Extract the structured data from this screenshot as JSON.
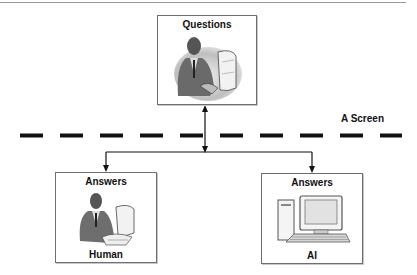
{
  "diagram": {
    "questions_box": {
      "title": "Questions",
      "icon": "person-at-computer-icon"
    },
    "screen_divider": {
      "label": "A Screen",
      "style": "dashed"
    },
    "answers_human_box": {
      "title": "Answers",
      "caption": "Human",
      "icon": "person-at-computer-icon"
    },
    "answers_ai_box": {
      "title": "Answers",
      "caption": "AI",
      "icon": "desktop-computer-icon"
    },
    "colors": {
      "line": "#111111",
      "box_border": "#6e6e6e",
      "dash": "#111111"
    }
  }
}
